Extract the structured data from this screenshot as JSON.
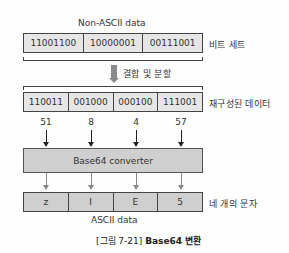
{
  "figure": {
    "top_label": "Non-ASCII data",
    "bit_set": {
      "cells": [
        "11001100",
        "10000001",
        "00111001"
      ],
      "side_label": "비트 세트"
    },
    "combine_split_label": "결합 및 분할",
    "reconstructed": {
      "cells": [
        "110011",
        "001000",
        "000100",
        "111001"
      ],
      "side_label": "재구성된 데이터"
    },
    "decimal_values": [
      "51",
      "8",
      "4",
      "57"
    ],
    "converter_label": "Base64 converter",
    "output": {
      "cells": [
        "z",
        "I",
        "E",
        "5"
      ],
      "side_label": "네 개의 문자"
    },
    "bottom_label": "ASCII data",
    "caption": {
      "prefix": "[그림 7-21]",
      "text": "Base64 변환"
    }
  }
}
